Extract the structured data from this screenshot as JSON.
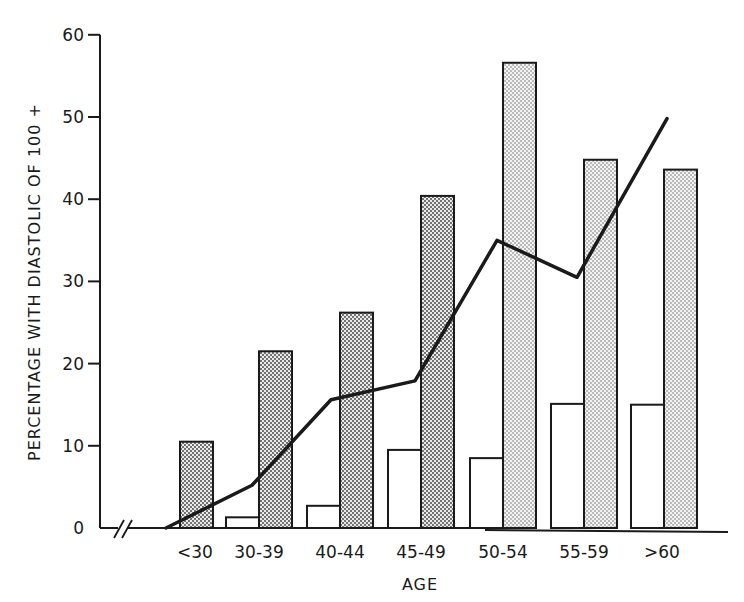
{
  "chart_data": {
    "type": "bar",
    "title": "",
    "xlabel": "AGE",
    "ylabel": "PERCENTAGE WITH DIASTOLIC OF 100 +",
    "ylim": [
      0,
      60
    ],
    "yticks": [
      0,
      10,
      20,
      30,
      40,
      50,
      60
    ],
    "ytick_labels": [
      "0",
      "10",
      "20",
      "30",
      "40",
      "50",
      "60"
    ],
    "categories": [
      "<30",
      "30-39",
      "40-44",
      "45-49",
      "50-54",
      "55-59",
      ">60"
    ],
    "grid": false,
    "legend": null,
    "axis_break": "x-axis break marks (//) near origin",
    "series": [
      {
        "name": "Open bars",
        "kind": "bar",
        "fill": "white",
        "values": [
          0,
          1.3,
          2.7,
          9.5,
          8.5,
          15.1,
          15.0
        ]
      },
      {
        "name": "Stippled bars",
        "kind": "bar",
        "fill": "stippled",
        "values": [
          10.5,
          21.5,
          26.2,
          40.4,
          56.6,
          44.8,
          43.6
        ]
      },
      {
        "name": "Line",
        "kind": "line",
        "values": [
          0,
          5.2,
          15.6,
          17.9,
          35.0,
          30.5,
          49.8
        ]
      }
    ]
  },
  "colors": {
    "ink": "#1a1a1a",
    "paper": "#ffffff",
    "stipple_dark": "#555555",
    "stipple_light": "#e6e6e6"
  }
}
